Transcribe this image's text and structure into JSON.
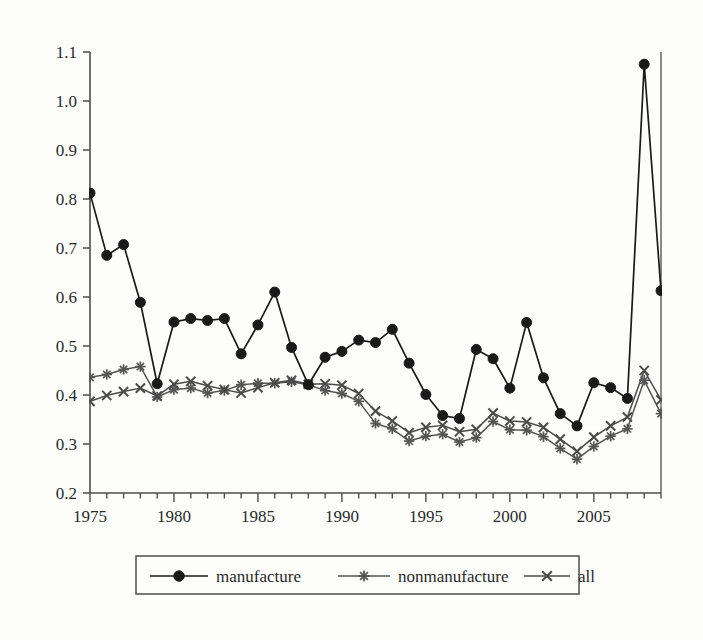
{
  "chart_data": {
    "type": "line",
    "title": "",
    "xlabel": "",
    "ylabel": "",
    "xlim": [
      1975,
      2009
    ],
    "ylim": [
      0.2,
      1.1
    ],
    "grid": false,
    "legend_position": "bottom",
    "x": [
      1975,
      1976,
      1977,
      1978,
      1979,
      1980,
      1981,
      1982,
      1983,
      1984,
      1985,
      1986,
      1987,
      1988,
      1989,
      1990,
      1991,
      1992,
      1993,
      1994,
      1995,
      1996,
      1997,
      1998,
      1999,
      2000,
      2001,
      2002,
      2003,
      2004,
      2005,
      2006,
      2007,
      2008,
      2009
    ],
    "xticklabels": [
      "1975",
      "1980",
      "1985",
      "1990",
      "1995",
      "2000",
      "2005"
    ],
    "xtickvalues": [
      1975,
      1980,
      1985,
      1990,
      1995,
      2000,
      2005
    ],
    "yticklabels": [
      "0.2",
      "0.3",
      "0.4",
      "0.5",
      "0.6",
      "0.7",
      "0.8",
      "0.9",
      "1.0",
      "1.1"
    ],
    "ytickvalues": [
      0.2,
      0.3,
      0.4,
      0.5,
      0.6,
      0.7,
      0.8,
      0.9,
      1.0,
      1.1
    ],
    "series": [
      {
        "name": "manufacture",
        "marker": "circle",
        "color": "#1a1a1a",
        "values": [
          0.812,
          0.685,
          0.707,
          0.589,
          0.423,
          0.549,
          0.556,
          0.552,
          0.556,
          0.484,
          0.543,
          0.61,
          0.497,
          0.421,
          0.477,
          0.489,
          0.512,
          0.507,
          0.534,
          0.465,
          0.401,
          0.358,
          0.352,
          0.493,
          0.474,
          0.414,
          0.548,
          0.435,
          0.362,
          0.337,
          0.425,
          0.415,
          0.393,
          1.075,
          0.613
        ]
      },
      {
        "name": "nonmanufacture",
        "marker": "star",
        "color": "#555555",
        "values": [
          0.436,
          0.442,
          0.452,
          0.458,
          0.396,
          0.411,
          0.414,
          0.404,
          0.409,
          0.421,
          0.424,
          0.424,
          0.427,
          0.421,
          0.409,
          0.403,
          0.387,
          0.342,
          0.331,
          0.306,
          0.316,
          0.32,
          0.304,
          0.313,
          0.346,
          0.329,
          0.328,
          0.315,
          0.291,
          0.269,
          0.295,
          0.316,
          0.331,
          0.43,
          0.362
        ]
      },
      {
        "name": "all",
        "marker": "x",
        "color": "#4a4a4a",
        "values": [
          0.387,
          0.399,
          0.407,
          0.414,
          0.398,
          0.422,
          0.428,
          0.419,
          0.411,
          0.404,
          0.415,
          0.425,
          0.43,
          0.422,
          0.423,
          0.42,
          0.403,
          0.367,
          0.347,
          0.323,
          0.334,
          0.338,
          0.325,
          0.33,
          0.363,
          0.347,
          0.345,
          0.334,
          0.31,
          0.285,
          0.314,
          0.337,
          0.355,
          0.45,
          0.39
        ]
      }
    ]
  },
  "legend": {
    "entries": [
      {
        "label": "manufacture",
        "marker": "circle"
      },
      {
        "label": "nonmanufacture",
        "marker": "star"
      },
      {
        "label": "all",
        "marker": "x"
      }
    ]
  }
}
